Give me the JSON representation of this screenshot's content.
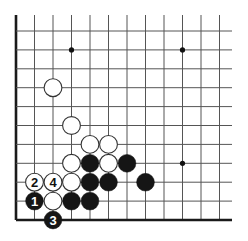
{
  "diagram": {
    "type": "go-board-corner",
    "corner": "bottom-left",
    "colors": {
      "background": "#ffffff",
      "line": "#555555",
      "edge": "#1a1a1a",
      "black_stone": "#151515",
      "white_stone": "#ffffff",
      "white_outline": "#333333"
    },
    "grid": {
      "origin_x": 16,
      "origin_y": 31,
      "step_x": 18.5,
      "step_y": 18.9,
      "cols": 12,
      "rows": 11,
      "top_extend_y": 15,
      "right_extend_x": 232
    },
    "star_points": [
      {
        "col": 3,
        "row": 1
      },
      {
        "col": 9,
        "row": 1
      },
      {
        "col": 9,
        "row": 7
      }
    ],
    "stones": [
      {
        "color": "white",
        "col": 2,
        "row": 3,
        "label": ""
      },
      {
        "color": "white",
        "col": 3,
        "row": 5,
        "label": ""
      },
      {
        "color": "white",
        "col": 4,
        "row": 6,
        "label": ""
      },
      {
        "color": "white",
        "col": 5,
        "row": 6,
        "label": ""
      },
      {
        "color": "white",
        "col": 3,
        "row": 7,
        "label": ""
      },
      {
        "color": "black",
        "col": 4,
        "row": 7,
        "label": ""
      },
      {
        "color": "white",
        "col": 5,
        "row": 7,
        "label": ""
      },
      {
        "color": "black",
        "col": 6,
        "row": 7,
        "label": ""
      },
      {
        "color": "white",
        "col": 1,
        "row": 8,
        "label": "2"
      },
      {
        "color": "white",
        "col": 2,
        "row": 8,
        "label": "4"
      },
      {
        "color": "white",
        "col": 3,
        "row": 8,
        "label": ""
      },
      {
        "color": "black",
        "col": 4,
        "row": 8,
        "label": ""
      },
      {
        "color": "black",
        "col": 5,
        "row": 8,
        "label": ""
      },
      {
        "color": "black",
        "col": 7,
        "row": 8,
        "label": ""
      },
      {
        "color": "black",
        "col": 1,
        "row": 9,
        "label": "1"
      },
      {
        "color": "white",
        "col": 2,
        "row": 9,
        "label": ""
      },
      {
        "color": "black",
        "col": 3,
        "row": 9,
        "label": ""
      },
      {
        "color": "black",
        "col": 4,
        "row": 9,
        "label": ""
      },
      {
        "color": "black",
        "col": 2,
        "row": 10,
        "label": "3"
      }
    ]
  }
}
